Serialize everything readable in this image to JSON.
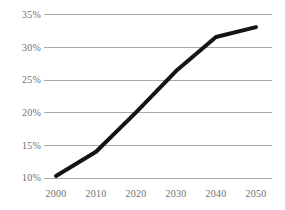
{
  "chart_data": {
    "type": "line",
    "title": "",
    "subtitle": "",
    "xlabel": "",
    "ylabel": "",
    "x": [
      2000,
      2010,
      2020,
      2030,
      2040,
      2050
    ],
    "categories": [
      "2000",
      "2010",
      "2020",
      "2030",
      "2040",
      "2050"
    ],
    "values": [
      10.3,
      14.0,
      20.0,
      26.3,
      31.5,
      33.0
    ],
    "series": [
      {
        "name": "",
        "values": [
          10.3,
          14.0,
          20.0,
          26.3,
          31.5,
          33.0
        ]
      }
    ],
    "xtick_labels": [
      "2000",
      "2010",
      "2020",
      "2030",
      "2040",
      "2050"
    ],
    "ytick_labels": [
      "10%",
      "15%",
      "20%",
      "25%",
      "30%",
      "35%"
    ],
    "ytick_values": [
      10,
      15,
      20,
      25,
      30,
      35
    ],
    "ylim": [
      10,
      35
    ],
    "xlim": [
      2000,
      2050
    ],
    "grid": "horizontal",
    "legend": "none",
    "annotations": [],
    "colors": {
      "line": "#141414",
      "grid": "#aaaaaa",
      "tick_label": "#6e6e6e",
      "background": "#ffffff"
    }
  },
  "axes": {
    "y_ticks": [
      {
        "label": "35%",
        "value": 35
      },
      {
        "label": "30%",
        "value": 30
      },
      {
        "label": "25%",
        "value": 25
      },
      {
        "label": "20%",
        "value": 20
      },
      {
        "label": "15%",
        "value": 15
      },
      {
        "label": "10%",
        "value": 10
      }
    ],
    "x_ticks": [
      {
        "label": "2000",
        "value": 2000
      },
      {
        "label": "2010",
        "value": 2010
      },
      {
        "label": "2020",
        "value": 2020
      },
      {
        "label": "2030",
        "value": 2030
      },
      {
        "label": "2040",
        "value": 2040
      },
      {
        "label": "2050",
        "value": 2050
      }
    ]
  }
}
